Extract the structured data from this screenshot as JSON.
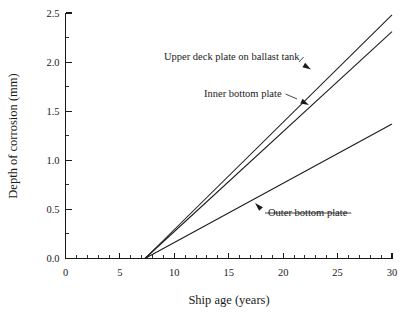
{
  "chart_data": {
    "type": "line",
    "title": "",
    "xlabel": "Ship age (years)",
    "ylabel": "Depth of corrosion (mm)",
    "xlim": [
      0,
      30
    ],
    "ylim": [
      0.0,
      2.5
    ],
    "grid": false,
    "legend_position": "none",
    "x_ticks": [
      0,
      5,
      10,
      15,
      20,
      25,
      30
    ],
    "x_tick_labels": [
      "0",
      "5",
      "10",
      "15",
      "20",
      "25",
      "30"
    ],
    "x_minor_tick_step": 1,
    "y_ticks": [
      0.0,
      0.5,
      1.0,
      1.5,
      2.0,
      2.5
    ],
    "y_tick_labels": [
      "0.0",
      "0.5",
      "1.0",
      "1.5",
      "2.0",
      "2.5"
    ],
    "y_minor_tick_step": 0.25,
    "corrosion_start_year": 7.3,
    "series": [
      {
        "name": "Upper deck plate on ballast tank",
        "x": [
          7.3,
          30
        ],
        "values": [
          0.0,
          2.48
        ]
      },
      {
        "name": "Inner bottom plate",
        "x": [
          7.3,
          30
        ],
        "values": [
          0.0,
          2.31
        ]
      },
      {
        "name": "Outer bottom plate",
        "x": [
          7.3,
          30
        ],
        "values": [
          0.0,
          1.37
        ]
      }
    ],
    "annotations": [
      {
        "text": "Upper deck plate on ballast tank",
        "target_x": 24.6,
        "target_y": 1.9
      },
      {
        "text": "Inner bottom plate",
        "target_x": 22.6,
        "target_y": 1.6
      },
      {
        "text": "Outer bottom plate",
        "target_x": 17.0,
        "target_y": 0.59
      }
    ]
  },
  "colors": {
    "background": "#ffffff",
    "ink": "#1a1a1a",
    "series": "#1a1a1a"
  }
}
